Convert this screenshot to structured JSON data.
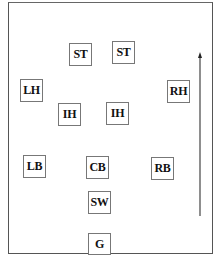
{
  "diagram": {
    "title": "",
    "field": {
      "border_color": "#555555",
      "background": "#ffffff"
    },
    "positions": [
      {
        "id": "st-left",
        "label": "ST",
        "x": 69,
        "y": 43
      },
      {
        "id": "st-right",
        "label": "ST",
        "x": 112,
        "y": 41
      },
      {
        "id": "lh",
        "label": "LH",
        "x": 20,
        "y": 79
      },
      {
        "id": "rh",
        "label": "RH",
        "x": 167,
        "y": 80
      },
      {
        "id": "ih-left",
        "label": "IH",
        "x": 58,
        "y": 103
      },
      {
        "id": "ih-right",
        "label": "IH",
        "x": 106,
        "y": 102
      },
      {
        "id": "lb",
        "label": "LB",
        "x": 23,
        "y": 155
      },
      {
        "id": "cb",
        "label": "CB",
        "x": 86,
        "y": 156
      },
      {
        "id": "rb",
        "label": "RB",
        "x": 151,
        "y": 157
      },
      {
        "id": "sw",
        "label": "SW",
        "x": 88,
        "y": 191
      },
      {
        "id": "g",
        "label": "G",
        "x": 88,
        "y": 233
      }
    ],
    "direction_arrow": {
      "orientation": "up",
      "meaning": "direction of attack"
    }
  }
}
